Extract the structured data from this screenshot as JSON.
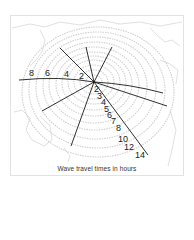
{
  "map": {
    "title": "",
    "caption": "Wave travel times in hours",
    "origin": {
      "name": "epicenter",
      "x": 94,
      "y": 82
    },
    "colors": {
      "coast": "#cfcfcf",
      "wave_bands": "#c8c8c8",
      "rays": "#1a1a1a",
      "text": "#222222",
      "frame": "#e2e2e2"
    },
    "west_ray_labels": [
      "8",
      "6",
      "4",
      "2"
    ],
    "southeast_ray_labels": [
      "2",
      "3",
      "4",
      "5",
      "6",
      "7",
      "8",
      "10",
      "12",
      "14"
    ]
  }
}
